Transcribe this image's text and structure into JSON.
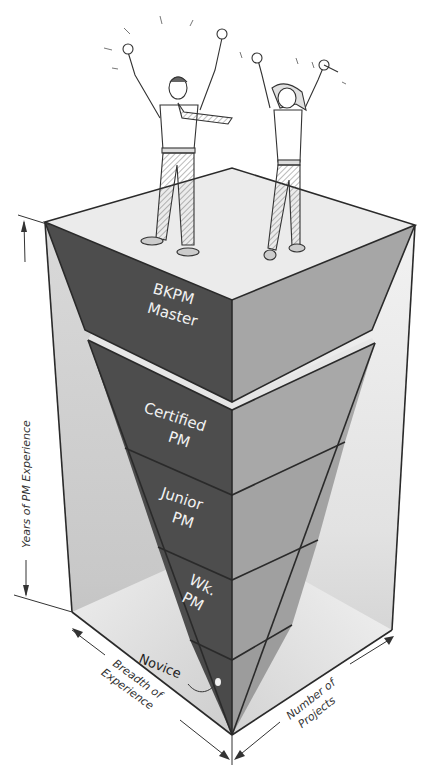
{
  "diagram": {
    "type": "inverted-pyramid-in-box",
    "levels": [
      {
        "id": "master",
        "lines": [
          "BKPM",
          "Master"
        ]
      },
      {
        "id": "certified",
        "lines": [
          "Certified",
          "PM"
        ]
      },
      {
        "id": "junior",
        "lines": [
          "Junior",
          "PM"
        ]
      },
      {
        "id": "working",
        "lines": [
          "Wk.",
          "PM"
        ]
      },
      {
        "id": "novice",
        "lines": [
          "Novice"
        ]
      }
    ],
    "axes": {
      "vertical": "Years of PM Experience",
      "left_depth": [
        "Breadth of",
        "Experience"
      ],
      "right_depth": [
        "Number of",
        "Projects"
      ]
    },
    "figures": [
      "celebrating-man",
      "celebrating-woman"
    ],
    "colors": {
      "dark_face": "#4d4d4d",
      "mid_face": "#9e9e9e",
      "light_face": "#e4e4e4",
      "top_face": "#ebebeb",
      "box_wall": "#cfcfcf",
      "line": "#2a2a2a"
    }
  }
}
